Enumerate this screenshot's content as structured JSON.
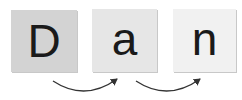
{
  "diagram": {
    "tiles": [
      {
        "letter": "D",
        "color": "#d3d3d3"
      },
      {
        "letter": "a",
        "color": "#e6e6e6"
      },
      {
        "letter": "n",
        "color": "#f1f1f1"
      }
    ],
    "arrows": [
      {
        "from": "D",
        "to": "a"
      },
      {
        "from": "a",
        "to": "n"
      }
    ],
    "arrow_color": "#333333"
  }
}
